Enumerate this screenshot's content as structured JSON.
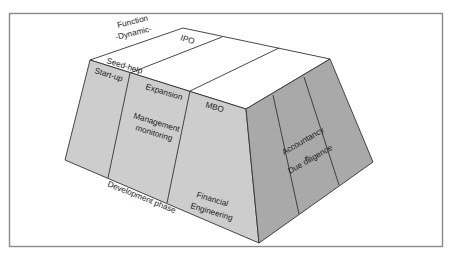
{
  "diagram": {
    "type": "3d-trapezoid-block",
    "colors": {
      "frame": "#8a8a8a",
      "top_face": "#ffffff",
      "front_face": "#cdcdcd",
      "right_face": "#a9a9a9",
      "edge": "#333333"
    },
    "axis_labels": {
      "function_line1": "Function",
      "function_line2": "-Dynamic-",
      "development_phase": "Development phase"
    },
    "top_face": {
      "strips": [
        {
          "label": "Seed-help"
        },
        {
          "label": "IPO"
        }
      ]
    },
    "front_face": {
      "columns": [
        {
          "label": "Start-up"
        },
        {
          "label": "Expansion",
          "sub_line1": "Management",
          "sub_line2": "monitoring"
        },
        {
          "label": "MBO",
          "sub_line1": "Financial",
          "sub_line2": "Engineering"
        }
      ]
    },
    "right_face": {
      "line1": "Accountancy",
      "line2": "+",
      "line3": "Due diligence"
    }
  }
}
